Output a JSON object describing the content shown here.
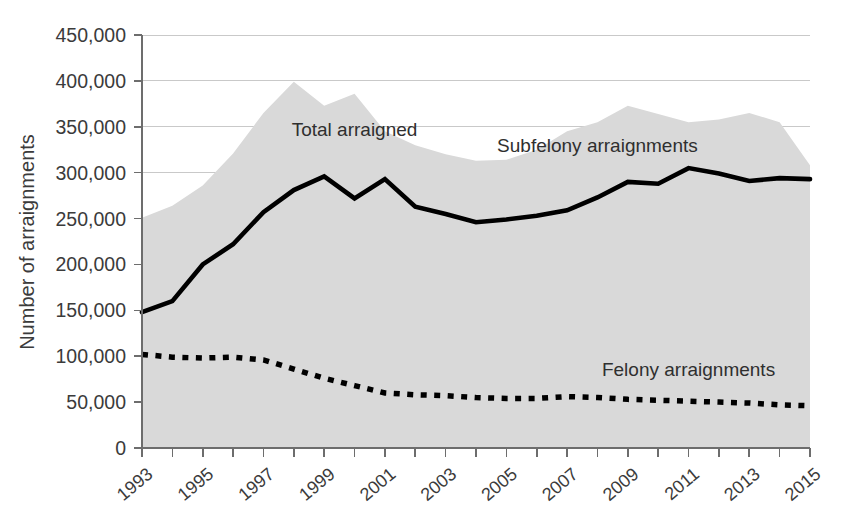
{
  "chart_data": {
    "type": "area",
    "title": "",
    "subtitle": "",
    "xlabel": "",
    "ylabel": "Number of arraignments",
    "xlim": [
      1993,
      2015
    ],
    "ylim": [
      0,
      450000
    ],
    "grid": true,
    "legend_position": "inline-annotations",
    "x": [
      1993,
      1994,
      1995,
      1996,
      1997,
      1998,
      1999,
      2000,
      2001,
      2002,
      2003,
      2004,
      2005,
      2006,
      2007,
      2008,
      2009,
      2010,
      2011,
      2012,
      2013,
      2014,
      2015
    ],
    "x_tick_labels": [
      "1993",
      "1995",
      "1997",
      "1999",
      "2001",
      "2003",
      "2005",
      "2007",
      "2009",
      "2011",
      "2013",
      "2015"
    ],
    "y_tick_labels": [
      "0",
      "50,000",
      "100,000",
      "150,000",
      "200,000",
      "250,000",
      "300,000",
      "350,000",
      "400,000",
      "450,000"
    ],
    "y_tick_values": [
      0,
      50000,
      100000,
      150000,
      200000,
      250000,
      300000,
      350000,
      400000,
      450000
    ],
    "series": [
      {
        "name": "Total arraigned",
        "render": "area",
        "color": "#d9d9d9",
        "label_x": 2000,
        "label_y": 340000,
        "values": [
          251000,
          264000,
          286000,
          321000,
          365000,
          399000,
          373000,
          386000,
          345000,
          330000,
          320000,
          313000,
          314000,
          325000,
          345000,
          355000,
          373000,
          364000,
          355000,
          358000,
          365000,
          355000,
          308000
        ]
      },
      {
        "name": "Subfelony arraignments",
        "render": "line",
        "color": "#000000",
        "style": "solid",
        "label_x": 2008,
        "label_y": 322000,
        "values": [
          148000,
          160000,
          200000,
          222000,
          257000,
          281000,
          296000,
          272000,
          293000,
          263000,
          255000,
          246000,
          249000,
          253000,
          259000,
          273000,
          290000,
          288000,
          305000,
          299000,
          291000,
          294000,
          293000
        ]
      },
      {
        "name": "Felony arraignments",
        "render": "line",
        "color": "#000000",
        "style": "dashed",
        "label_x": 2011,
        "label_y": 78000,
        "values": [
          102000,
          99000,
          98000,
          99000,
          96000,
          86000,
          76000,
          68000,
          60000,
          58000,
          57000,
          55000,
          54000,
          54000,
          56000,
          55000,
          53000,
          52000,
          51000,
          50000,
          49000,
          47000,
          46000
        ]
      }
    ],
    "subfelony_tail_note": {
      "values_corrected": [
        148000,
        160000,
        200000,
        222000,
        257000,
        281000,
        296000,
        272000,
        293000,
        263000,
        255000,
        246000,
        249000,
        253000,
        259000,
        273000,
        290000,
        288000,
        305000,
        299000,
        291000,
        294000,
        288000,
        250000
      ]
    }
  },
  "annotations": {
    "total": "Total arraigned",
    "subfelony": "Subfelony arraignments",
    "felony": "Felony arraignments"
  },
  "axes": {
    "y_title": "Number of arraignments"
  }
}
